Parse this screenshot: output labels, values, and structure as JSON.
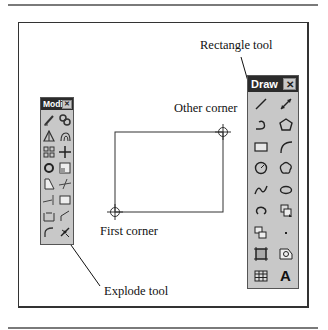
{
  "annotations": {
    "rectangle_tool": "Rectangle tool",
    "other_corner": "Other corner",
    "first_corner": "First corner",
    "explode_tool": "Explode tool"
  },
  "modify_toolbar": {
    "title": "Modify",
    "close": "✕",
    "tools": [
      "erase",
      "copy",
      "mirror",
      "offset",
      "array",
      "move",
      "rotate",
      "scale",
      "stretch",
      "trim",
      "extend",
      "break",
      "chamfer",
      "fillet",
      "fillet-arc",
      "explode"
    ]
  },
  "draw_toolbar": {
    "title": "Draw",
    "close": "✕",
    "tools": [
      "line",
      "construction-line",
      "polyline",
      "polygon",
      "rectangle",
      "arc",
      "circle",
      "revision-cloud",
      "spline",
      "ellipse",
      "ellipse-arc",
      "insert-block",
      "make-block",
      "point",
      "hatch",
      "region",
      "table",
      "multiline-text"
    ],
    "text_tool_glyph": "A"
  },
  "colors": {
    "toolbar_bg": "#c8c8c8",
    "title_bg": "#2b2b2b",
    "frame": "#333333",
    "rule": "#7a7a7a"
  }
}
